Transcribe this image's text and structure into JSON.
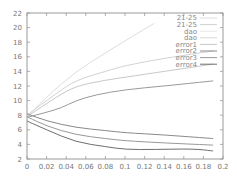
{
  "chart_data": {
    "type": "line",
    "title": "",
    "xlabel": "",
    "ylabel": "",
    "xlim": [
      0,
      0.2
    ],
    "ylim": [
      2,
      22
    ],
    "grid": false,
    "legend_position": "top-right (inside)",
    "x_ticks": [
      "0",
      "0.02",
      "0.04",
      "0.06",
      "0.08",
      "0.1",
      "0.12",
      "0.14",
      "0.16",
      "0.18",
      "0.2"
    ],
    "y_ticks": [
      "2",
      "4",
      "6",
      "8",
      "10",
      "12",
      "14",
      "16",
      "18",
      "20",
      "22"
    ],
    "series": [
      {
        "name": "21-25",
        "color": "#dedede",
        "x": [
          0,
          0.02,
          0.05,
          0.08,
          0.1,
          0.13
        ],
        "values": [
          7.8,
          10.5,
          14.0,
          16.5,
          18.2,
          20.6
        ]
      },
      {
        "name": "21-25",
        "color": "#d2d2d2",
        "x": [
          0,
          0.03,
          0.05,
          0.08,
          0.1,
          0.14,
          0.19
        ],
        "values": [
          8.0,
          11.0,
          12.8,
          14.0,
          14.8,
          15.8,
          16.8
        ]
      },
      {
        "name": "dao",
        "color": "#c8c8c8",
        "x": [
          0,
          0.03,
          0.05,
          0.08,
          0.1,
          0.14,
          0.19
        ],
        "values": [
          7.8,
          10.5,
          12.0,
          12.8,
          13.2,
          14.0,
          15.0
        ]
      },
      {
        "name": "dao",
        "color": "#9a9a9a",
        "x": [
          0,
          0.02,
          0.035,
          0.05,
          0.07,
          0.1,
          0.14,
          0.19
        ],
        "values": [
          7.7,
          8.4,
          9.0,
          10.0,
          10.8,
          11.5,
          12.0,
          12.7
        ]
      },
      {
        "name": "error1",
        "color": "#b0b0b0",
        "x": [
          0
        ],
        "values": [
          null
        ]
      },
      {
        "name": "error2",
        "color": "#8a8a8a",
        "x": [
          0,
          0.02,
          0.05,
          0.08,
          0.1,
          0.14,
          0.19
        ],
        "values": [
          8.2,
          7.2,
          6.3,
          5.9,
          5.6,
          5.3,
          4.8
        ]
      },
      {
        "name": "error3",
        "color": "#999999",
        "x": [
          0,
          0.02,
          0.05,
          0.08,
          0.1,
          0.14,
          0.19
        ],
        "values": [
          7.8,
          6.5,
          5.3,
          4.8,
          4.5,
          4.2,
          3.9
        ]
      },
      {
        "name": "error4",
        "color": "#6e6e6e",
        "x": [
          0,
          0.02,
          0.05,
          0.08,
          0.1,
          0.13,
          0.17,
          0.19
        ],
        "values": [
          7.2,
          6.0,
          4.3,
          3.7,
          3.3,
          3.3,
          3.4,
          3.1
        ]
      }
    ]
  },
  "legend": {
    "items": [
      {
        "label": "21-25",
        "color": "#dedede"
      },
      {
        "label": "21-25",
        "color": "#d2d2d2"
      },
      {
        "label": "dao",
        "color": "#e6e6e6"
      },
      {
        "label": "dao",
        "color": "#d6d6d6"
      },
      {
        "label": "error1",
        "color": "#c8c8c8"
      },
      {
        "label": "error2",
        "color": "#8a8a8a"
      },
      {
        "label": "error3",
        "color": "#999999"
      },
      {
        "label": "error4",
        "color": "#6e6e6e"
      }
    ]
  },
  "plot": {
    "left": 27,
    "right": 223,
    "top": 13,
    "bottom": 159,
    "axis_color": "#9a9a9a"
  }
}
